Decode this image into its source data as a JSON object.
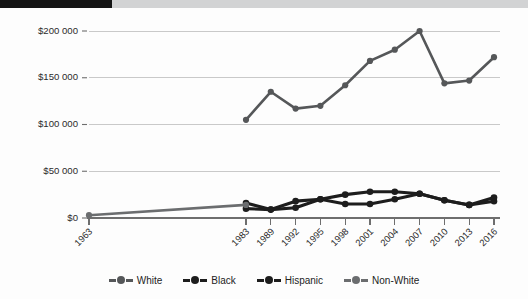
{
  "figure": {
    "background_color": "#fdfdfd",
    "top_band": {
      "black_color": "#151515",
      "gray_color": "#d2d3d4"
    }
  },
  "chart_data": {
    "type": "line",
    "title": "",
    "subtitle": "",
    "xlabel": "",
    "ylabel": "",
    "grid": "horizontal",
    "legend_position": "bottom-center",
    "x": [
      "1963",
      "1983",
      "1989",
      "1992",
      "1995",
      "1998",
      "2001",
      "2004",
      "2007",
      "2010",
      "2013",
      "2016"
    ],
    "categories": [
      "1963",
      "1983",
      "1989",
      "1992",
      "1995",
      "1998",
      "2001",
      "2004",
      "2007",
      "2010",
      "2013",
      "2016"
    ],
    "ylim": [
      0,
      200000
    ],
    "yticks": [
      0,
      50000,
      100000,
      150000,
      200000
    ],
    "ytick_labels": [
      "$0",
      "$50 000",
      "$100 000",
      "$150 000",
      "$200 000"
    ],
    "series": [
      {
        "name": "White",
        "color": "#555759",
        "values": [
          null,
          105000,
          135000,
          117000,
          120000,
          142000,
          168000,
          180000,
          200000,
          144000,
          147000,
          172000
        ]
      },
      {
        "name": "Black",
        "color": "#1d1d1d",
        "values": [
          null,
          10000,
          9000,
          11000,
          20000,
          15000,
          15000,
          20000,
          26000,
          19000,
          14000,
          18000
        ]
      },
      {
        "name": "Hispanic",
        "color": "#1d1d1d",
        "values": [
          null,
          16000,
          9000,
          18000,
          20000,
          25000,
          28000,
          28000,
          26000,
          19000,
          14000,
          22000
        ]
      },
      {
        "name": "Non-White",
        "color": "#6b6d6f",
        "values": [
          3000,
          14000,
          null,
          null,
          null,
          null,
          null,
          null,
          null,
          null,
          null,
          null
        ]
      }
    ]
  },
  "legend": {
    "items": [
      {
        "label": "White",
        "color": "#555759"
      },
      {
        "label": "Black",
        "color": "#1d1d1d"
      },
      {
        "label": "Hispanic",
        "color": "#1d1d1d"
      },
      {
        "label": "Non-White",
        "color": "#6b6d6f"
      }
    ]
  }
}
